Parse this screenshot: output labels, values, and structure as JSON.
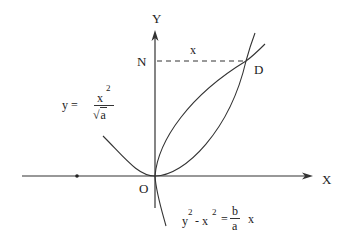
{
  "diagram": {
    "axes": {
      "x_label": "X",
      "y_label": "Y",
      "origin_label": "O"
    },
    "points": {
      "N": "N",
      "D": "D"
    },
    "segment_label": "x",
    "curves": {
      "parabola": {
        "lhs": "y =",
        "numerator": "x",
        "numerator_exp": "2",
        "denominator_root": "√",
        "denominator": "a"
      },
      "hyperbola": {
        "y": "y",
        "y_exp": "2",
        "minus": "- x",
        "x_exp": "2",
        "equals": "=",
        "numerator": "b",
        "denominator": "a",
        "rhs": "x"
      }
    },
    "colors": {
      "stroke": "#333333",
      "background": "#ffffff"
    }
  }
}
